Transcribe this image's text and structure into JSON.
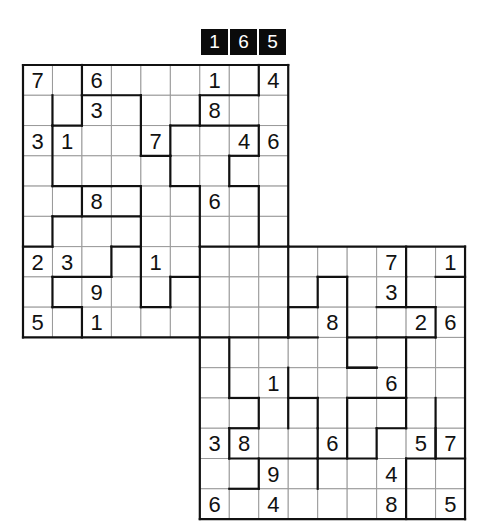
{
  "puzzle": {
    "id_digits": [
      "1",
      "6",
      "5"
    ],
    "type": "Samurai-style overlapping jigsaw sudoku (two 9x9 grids)",
    "grid_size": 15,
    "grids": [
      {
        "name": "top-left",
        "row_offset": 0,
        "col_offset": 0
      },
      {
        "name": "bottom-right",
        "row_offset": 6,
        "col_offset": 6
      }
    ],
    "givens": [
      {
        "r": 0,
        "c": 0,
        "v": "7"
      },
      {
        "r": 0,
        "c": 2,
        "v": "6"
      },
      {
        "r": 0,
        "c": 6,
        "v": "1"
      },
      {
        "r": 0,
        "c": 8,
        "v": "4"
      },
      {
        "r": 1,
        "c": 2,
        "v": "3"
      },
      {
        "r": 1,
        "c": 6,
        "v": "8"
      },
      {
        "r": 2,
        "c": 0,
        "v": "3"
      },
      {
        "r": 2,
        "c": 1,
        "v": "1"
      },
      {
        "r": 2,
        "c": 4,
        "v": "7"
      },
      {
        "r": 2,
        "c": 7,
        "v": "4"
      },
      {
        "r": 2,
        "c": 8,
        "v": "6"
      },
      {
        "r": 4,
        "c": 2,
        "v": "8"
      },
      {
        "r": 4,
        "c": 6,
        "v": "6"
      },
      {
        "r": 6,
        "c": 0,
        "v": "2"
      },
      {
        "r": 6,
        "c": 1,
        "v": "3"
      },
      {
        "r": 6,
        "c": 4,
        "v": "1"
      },
      {
        "r": 6,
        "c": 12,
        "v": "7"
      },
      {
        "r": 6,
        "c": 14,
        "v": "1"
      },
      {
        "r": 7,
        "c": 2,
        "v": "9"
      },
      {
        "r": 7,
        "c": 12,
        "v": "3"
      },
      {
        "r": 8,
        "c": 0,
        "v": "5"
      },
      {
        "r": 8,
        "c": 2,
        "v": "1"
      },
      {
        "r": 8,
        "c": 10,
        "v": "8"
      },
      {
        "r": 8,
        "c": 13,
        "v": "2"
      },
      {
        "r": 8,
        "c": 14,
        "v": "6"
      },
      {
        "r": 10,
        "c": 8,
        "v": "1"
      },
      {
        "r": 10,
        "c": 12,
        "v": "6"
      },
      {
        "r": 12,
        "c": 6,
        "v": "3"
      },
      {
        "r": 12,
        "c": 7,
        "v": "8"
      },
      {
        "r": 12,
        "c": 10,
        "v": "6"
      },
      {
        "r": 12,
        "c": 13,
        "v": "5"
      },
      {
        "r": 12,
        "c": 14,
        "v": "7"
      },
      {
        "r": 13,
        "c": 8,
        "v": "9"
      },
      {
        "r": 13,
        "c": 12,
        "v": "4"
      },
      {
        "r": 14,
        "c": 6,
        "v": "6"
      },
      {
        "r": 14,
        "c": 8,
        "v": "4"
      },
      {
        "r": 14,
        "c": 12,
        "v": "8"
      },
      {
        "r": 14,
        "c": 14,
        "v": "5"
      }
    ]
  }
}
